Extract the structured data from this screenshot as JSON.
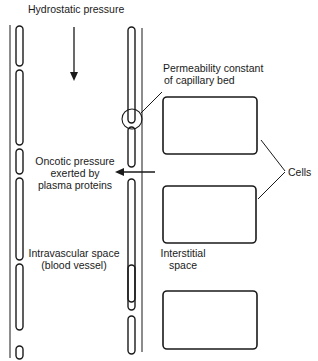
{
  "labels": {
    "hydrostatic": "Hydrostatic pressure",
    "permeability_line1": "Permeability constant",
    "permeability_line2": "of capillary bed",
    "oncotic_line1": "Oncotic pressure",
    "oncotic_line2": "exerted by",
    "oncotic_line3": "plasma proteins",
    "cells": "Cells",
    "intravascular_line1": "Intravascular space",
    "intravascular_line2": "(blood vessel)",
    "interstitial_line1": "Interstitial",
    "interstitial_line2": "space"
  },
  "colors": {
    "stroke": "#1a1a1a",
    "background": "#ffffff"
  },
  "structures": {
    "left_vessel_wall_segments": 6,
    "right_vessel_wall_segments": 6,
    "cells": 3
  }
}
